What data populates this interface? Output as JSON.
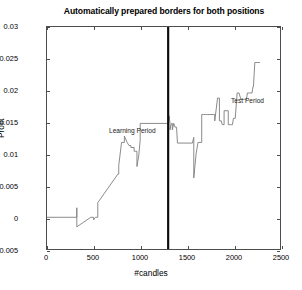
{
  "chart_data": {
    "type": "line",
    "title": "Automatically prepared borders for both positions",
    "xlabel": "#candles",
    "ylabel": "Profit",
    "xlim": [
      0,
      2500
    ],
    "ylim": [
      -0.005,
      0.03
    ],
    "xticks": [
      0,
      500,
      1000,
      1500,
      2000,
      2500
    ],
    "xticklabels": [
      "0",
      "500",
      "1000",
      "1500",
      "2000",
      "2500"
    ],
    "yticks": [
      -0.005,
      0,
      0.005,
      0.01,
      0.015,
      0.02,
      0.025,
      0.03
    ],
    "yticklabels": [
      "-0.005",
      "0",
      "0.005",
      "0.01",
      "0.015",
      "0.02",
      "0.025",
      "0.03"
    ],
    "grid": false,
    "legend": null,
    "line_color": "#7d7d7d",
    "annotations": [
      {
        "text": "Learning Period",
        "x": 180,
        "y": 0.0205
      },
      {
        "text": "Test Period",
        "x": 1490,
        "y": 0.0252
      }
    ],
    "vlines": [
      {
        "x": 1300,
        "color": "#0d0d0d",
        "label": "period-divider"
      }
    ],
    "series": [
      {
        "name": "Profit",
        "x": [
          0,
          320,
          320,
          320,
          470,
          470,
          500,
          500,
          520,
          545,
          545,
          760,
          760,
          770,
          770,
          800,
          830,
          830,
          860,
          860,
          880,
          900,
          900,
          935,
          935,
          950,
          965,
          965,
          985,
          1000,
          1000,
          1290,
          1300,
          1310,
          1320,
          1320,
          1335,
          1345,
          1345,
          1360,
          1375,
          1390,
          1400,
          1400,
          1560,
          1560,
          1575,
          1575,
          1600,
          1620,
          1660,
          1660,
          1680,
          1700,
          1720,
          1740,
          1760,
          1790,
          1800,
          1800,
          1830,
          1850,
          1850,
          1870,
          1880,
          1900,
          1900,
          1930,
          1945,
          1945,
          1970,
          1990,
          2000,
          2020,
          2040,
          2060,
          2080,
          2100,
          2120,
          2140,
          2150,
          2160,
          2180,
          2200,
          2210,
          2215,
          2230,
          2260,
          2285
        ],
        "y": [
          0.0,
          0.0,
          0.0015,
          -0.0015,
          0.0,
          0.0,
          0.0,
          -0.0004,
          0.0,
          0.0,
          0.0023,
          0.0068,
          0.0068,
          0.0068,
          0.0082,
          0.0118,
          0.0118,
          0.0128,
          0.0118,
          0.0118,
          0.0113,
          0.0113,
          0.011,
          0.011,
          0.0104,
          0.0104,
          0.0104,
          0.008,
          0.0098,
          0.0122,
          0.0148,
          0.0148,
          0.0148,
          0.016,
          0.0148,
          0.0138,
          0.0148,
          0.0148,
          0.0138,
          0.0148,
          0.0142,
          0.0142,
          0.0117,
          0.0117,
          0.0117,
          0.0117,
          0.0126,
          0.0062,
          0.01,
          0.0118,
          0.0118,
          0.0162,
          0.0162,
          0.0162,
          0.0162,
          0.0162,
          0.0162,
          0.0162,
          0.0162,
          0.0152,
          0.0188,
          0.0188,
          0.0152,
          0.0152,
          0.0146,
          0.0146,
          0.0168,
          0.0168,
          0.0168,
          0.0146,
          0.0146,
          0.0146,
          0.0156,
          0.0156,
          0.0196,
          0.0196,
          0.0186,
          0.0186,
          0.0186,
          0.0186,
          0.0196,
          0.0196,
          0.0196,
          0.0196,
          0.0206,
          0.0206,
          0.0244,
          0.0244,
          0.0244
        ]
      }
    ]
  },
  "figure": {
    "background_color": "#ffffff",
    "axis_color": "#4d4d4d"
  }
}
